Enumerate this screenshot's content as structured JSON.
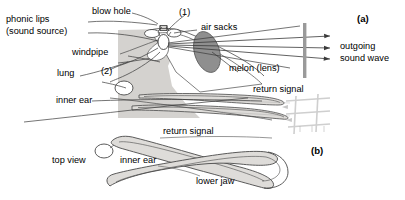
{
  "figure": {
    "colors": {
      "outline": "#3a3a3a",
      "body_fill": "#d4d2cf",
      "melon_fill": "#8f8f8f",
      "jaw_fill": "#dedcd9",
      "target_bar": "#9a9a9a",
      "return_grid": "#b9b9b9",
      "text": "#000000",
      "background": "#ffffff"
    },
    "panels": [
      {
        "id": "panel-a",
        "label": "(a)",
        "description": "side view of head showing sound production and outgoing beam"
      },
      {
        "id": "panel-b",
        "label": "(b)",
        "description": "top view of lower jaw showing return signal reception"
      }
    ],
    "labels": {
      "phonic_lips_line1": "phonic lips",
      "phonic_lips_line2": "(sound source)",
      "blow_hole": "blow hole",
      "marker_one": "(1)",
      "air_sacks": "air sacks",
      "windpipe": "windpipe",
      "marker_two": "(2)",
      "lung": "lung",
      "melon": "melon (lens)",
      "inner_ear_a": "inner ear",
      "outgoing_line1": "outgoing",
      "outgoing_line2": "sound wave",
      "return_signal_a": "return signal",
      "return_signal_b": "return signal",
      "top_view": "top view",
      "inner_ear_b": "inner ear",
      "lower_jaw": "lower jaw",
      "panel_a": "(a)",
      "panel_b": "(b)"
    }
  }
}
